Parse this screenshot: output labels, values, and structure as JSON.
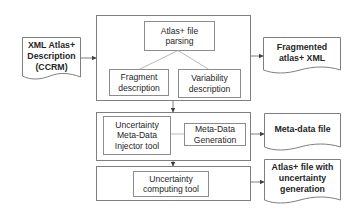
{
  "diagram": {
    "inputs": [
      {
        "id": "xml-input",
        "label_lines": [
          "XML Atlas+",
          "Description",
          "(CCRM)"
        ]
      }
    ],
    "stages": [
      {
        "id": "parsing-stage",
        "nodes": [
          {
            "id": "atlas-parsing",
            "label_lines": [
              "Atlas+ file",
              "parsing"
            ]
          },
          {
            "id": "fragment-description",
            "label_lines": [
              "Fragment",
              "description"
            ]
          },
          {
            "id": "variability-description",
            "label_lines": [
              "Variability",
              "description"
            ]
          }
        ]
      },
      {
        "id": "injector-stage",
        "nodes": [
          {
            "id": "injector-tool",
            "label_lines": [
              "Uncertainty",
              "Meta-Data",
              "Injector tool"
            ]
          },
          {
            "id": "metadata-generation",
            "label_lines": [
              "Meta-Data",
              "Generation"
            ]
          }
        ]
      },
      {
        "id": "computing-stage",
        "nodes": [
          {
            "id": "computing-tool",
            "label_lines": [
              "Uncertainty",
              "computing tool"
            ]
          }
        ]
      }
    ],
    "outputs": [
      {
        "id": "fragmented-xml",
        "label_lines": [
          "Fragmented",
          "atlas+ XML"
        ]
      },
      {
        "id": "metadata-file",
        "label_lines": [
          "Meta-data file"
        ]
      },
      {
        "id": "atlas-uncertainty",
        "label_lines": [
          "Atlas+ file with",
          "uncertainty",
          "generation"
        ]
      }
    ],
    "edges": [
      {
        "from": "xml-input",
        "to": "parsing-stage"
      },
      {
        "from": "atlas-parsing",
        "to": "fragment-description"
      },
      {
        "from": "atlas-parsing",
        "to": "variability-description"
      },
      {
        "from": "parsing-stage",
        "to": "fragmented-xml"
      },
      {
        "from": "parsing-stage",
        "to": "injector-stage"
      },
      {
        "from": "injector-stage",
        "to": "metadata-file"
      },
      {
        "from": "injector-stage",
        "to": "computing-stage"
      },
      {
        "from": "computing-stage",
        "to": "atlas-uncertainty"
      }
    ]
  }
}
